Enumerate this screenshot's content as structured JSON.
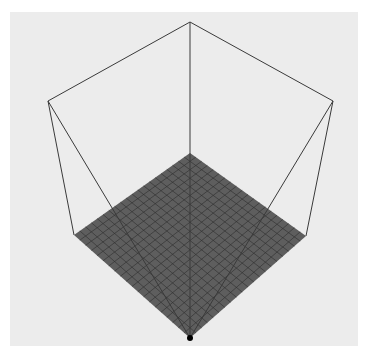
{
  "scene": {
    "description": "3D wireframe cube viewed from above with a gridded floor plane",
    "background_color": "#ffffff",
    "panel_color": "#ececec",
    "edge_color": "#3a3a3a",
    "floor_color": "#5e5e5e",
    "grid_line_color": "#2e2e2e",
    "grid_divisions": 20,
    "vertices": {
      "top": [
        190,
        22
      ],
      "upper_left": [
        48,
        101
      ],
      "upper_right": [
        333,
        101
      ],
      "floor_back": [
        190,
        153
      ],
      "floor_left": [
        74,
        235
      ],
      "floor_right": [
        306,
        236
      ],
      "floor_front": [
        190,
        338
      ]
    },
    "origin_marker": {
      "position": [
        190,
        338
      ],
      "color": "#000000"
    }
  }
}
